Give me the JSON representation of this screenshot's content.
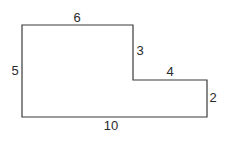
{
  "diagram": {
    "type": "composite-rectilinear-figure",
    "stroke_color": "#3a3a3a",
    "text_color": "#2a2a2a",
    "vertices": [
      [
        22,
        25
      ],
      [
        133,
        25
      ],
      [
        133,
        80
      ],
      [
        207,
        80
      ],
      [
        207,
        117
      ],
      [
        22,
        117
      ]
    ],
    "labels": {
      "top": "6",
      "step_vertical": "3",
      "step_horizontal": "4",
      "right": "2",
      "bottom": "10",
      "left": "5"
    }
  }
}
